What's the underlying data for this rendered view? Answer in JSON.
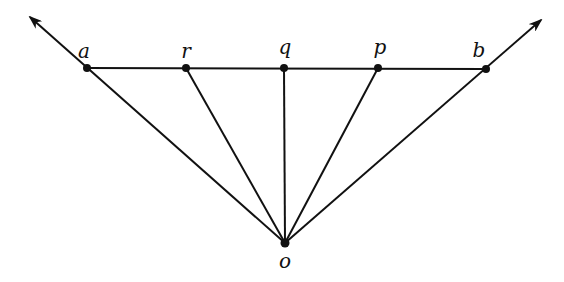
{
  "diagram": {
    "type": "geometry",
    "colors": {
      "stroke": "#111111",
      "background": "#ffffff"
    },
    "points": {
      "a": {
        "label": "a",
        "x": 87,
        "y": 68
      },
      "r": {
        "label": "r",
        "x": 186,
        "y": 68
      },
      "q": {
        "label": "q",
        "x": 284,
        "y": 68
      },
      "p": {
        "label": "p",
        "x": 378,
        "y": 68
      },
      "b": {
        "label": "b",
        "x": 486,
        "y": 69
      },
      "o": {
        "label": "o",
        "x": 285,
        "y": 243
      }
    },
    "segments": [
      {
        "from": "a",
        "to": "b"
      },
      {
        "from": "o",
        "to": "r"
      },
      {
        "from": "o",
        "to": "q"
      },
      {
        "from": "o",
        "to": "p"
      }
    ],
    "rays": [
      {
        "from": "o",
        "through": "a",
        "arrow_tip": {
          "x": 30,
          "y": 17
        }
      },
      {
        "from": "o",
        "through": "b",
        "arrow_tip": {
          "x": 541,
          "y": 20
        }
      }
    ]
  }
}
